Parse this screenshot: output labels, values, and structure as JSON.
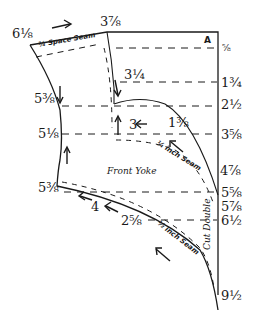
{
  "diagram": {
    "title": "Front Yoke",
    "corner_label": "A",
    "fold_label": "Cut Double",
    "seam_labels": {
      "shoulder": "¾ Space Seam",
      "armhole": "¼ inch Seam",
      "bottom": "½ inch Seam"
    },
    "right_scale": [
      "⅝",
      "1¾",
      "2½",
      "3⅝",
      "4⅞",
      "5⅝",
      "5⅞",
      "6½",
      "9½"
    ],
    "left_points": [
      "6⅛",
      "5⅜",
      "5⅛",
      "5⅜"
    ],
    "top_points": [
      "3⅞"
    ],
    "interior_points": [
      "3¼",
      "3",
      "1⅜",
      "4",
      "2⅝"
    ],
    "line_color": "#1a1a1a",
    "background": "#ffffff"
  }
}
